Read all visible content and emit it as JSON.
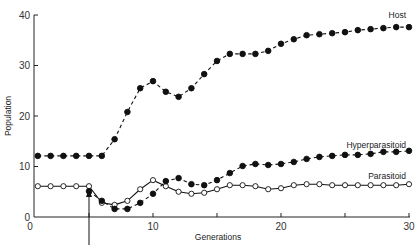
{
  "chart_data": {
    "type": "line",
    "title": "",
    "xlabel": "Generations",
    "ylabel": "Population",
    "xlim": [
      0,
      30
    ],
    "ylim": [
      0,
      40
    ],
    "x_ticks": [
      0,
      5,
      10,
      15,
      20,
      25,
      30
    ],
    "x_tick_labels": [
      "0",
      "",
      "10",
      "",
      "20",
      "",
      "30"
    ],
    "y_ticks": [
      0,
      10,
      20,
      30,
      40
    ],
    "y_tick_labels": [
      "0",
      "10",
      "20",
      "30",
      "40"
    ],
    "grid": false,
    "legend": "inline labels at right end of each series",
    "annotations": [
      {
        "type": "arrow",
        "x": 5,
        "direction": "up",
        "note": "introduction point at generation 5"
      }
    ],
    "x": [
      1,
      2,
      3,
      4,
      5,
      6,
      7,
      8,
      9,
      10,
      11,
      12,
      13,
      14,
      15,
      16,
      17,
      18,
      19,
      20,
      21,
      22,
      23,
      24,
      25,
      26,
      27,
      28,
      29,
      30
    ],
    "series": [
      {
        "name": "Host",
        "marker": "filled-circle",
        "line": "dashed",
        "values": [
          12.1,
          12.1,
          12.1,
          12.1,
          12.1,
          12.1,
          15.4,
          20.8,
          25.5,
          26.9,
          24.8,
          23.8,
          25.5,
          28.3,
          30.9,
          32.3,
          32.3,
          32.3,
          32.9,
          34.3,
          35.2,
          36.0,
          36.2,
          36.4,
          36.6,
          37.0,
          37.2,
          37.4,
          37.6,
          37.6
        ]
      },
      {
        "name": "Parasitoid",
        "marker": "open-circle",
        "line": "solid",
        "values": [
          6.1,
          6.1,
          6.1,
          6.1,
          6.1,
          2.8,
          2.4,
          3.2,
          5.5,
          7.3,
          6.1,
          5.0,
          4.6,
          4.8,
          5.5,
          6.3,
          6.3,
          6.1,
          5.5,
          5.7,
          6.3,
          6.5,
          6.5,
          6.3,
          6.3,
          6.3,
          6.3,
          6.3,
          6.3,
          6.5
        ]
      },
      {
        "name": "Hyperparasitoid",
        "marker": "filled-circle",
        "line": "dashed",
        "start_x": 5,
        "values": [
          null,
          null,
          null,
          null,
          5.1,
          3.2,
          1.6,
          1.6,
          2.8,
          4.6,
          7.1,
          7.7,
          6.5,
          6.3,
          7.3,
          8.7,
          10.1,
          10.5,
          10.3,
          10.5,
          10.9,
          11.5,
          11.9,
          12.1,
          12.3,
          12.3,
          12.5,
          12.9,
          12.9,
          13.1
        ]
      }
    ]
  },
  "labels": {
    "xlabel": "Generations",
    "ylabel": "Population",
    "host": "Host",
    "parasitoid": "Parasitoid",
    "hyperparasitoid": "Hyperparasitoid"
  }
}
